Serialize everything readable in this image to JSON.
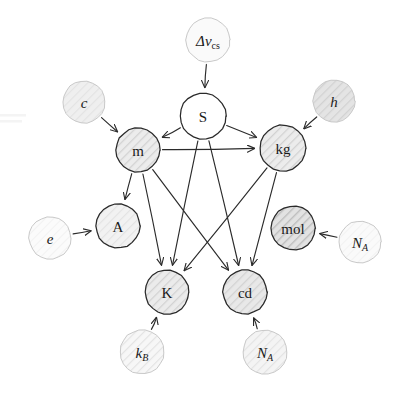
{
  "diagram": {
    "style": "hand-drawn sketch",
    "background_color": "#ffffff",
    "node_outline_color": "#2a2a2a",
    "constant_outline_color": "#c9c9c9",
    "edge_color": "#2b2b2b",
    "label_color": "#1a1a1a"
  },
  "nodes": {
    "dnu_cs": {
      "label": "Δν",
      "subscript": "cs",
      "kind": "constant",
      "cx": 208,
      "cy": 40,
      "r": 22,
      "fill": "#fafafa",
      "hatch": "none"
    },
    "c": {
      "label": "c",
      "subscript": "",
      "kind": "constant",
      "cx": 84,
      "cy": 102,
      "r": 21,
      "fill": "#efefef",
      "hatch": "light"
    },
    "h": {
      "label": "h",
      "subscript": "",
      "kind": "constant",
      "cx": 334,
      "cy": 101,
      "r": 21,
      "fill": "#e4e4e4",
      "hatch": "medium"
    },
    "e": {
      "label": "e",
      "subscript": "",
      "kind": "constant",
      "cx": 50,
      "cy": 238,
      "r": 21,
      "fill": "#fbfbfb",
      "hatch": "faint"
    },
    "NA_mol": {
      "label": "N",
      "subscript": "A",
      "kind": "constant",
      "cx": 360,
      "cy": 242,
      "r": 21,
      "fill": "#fafafa",
      "hatch": "faint"
    },
    "kB": {
      "label": "k",
      "subscript": "B",
      "kind": "constant",
      "cx": 142,
      "cy": 352,
      "r": 22,
      "fill": "#f7f7f7",
      "hatch": "light"
    },
    "NA_cd": {
      "label": "N",
      "subscript": "A",
      "kind": "constant",
      "cx": 265,
      "cy": 352,
      "r": 22,
      "fill": "#f4f4f4",
      "hatch": "light"
    },
    "S": {
      "label": "S",
      "subscript": "",
      "kind": "unit",
      "cx": 203,
      "cy": 116,
      "r": 23,
      "fill": "#ffffff",
      "hatch": "none"
    },
    "m": {
      "label": "m",
      "subscript": "",
      "kind": "unit",
      "cx": 138,
      "cy": 150,
      "r": 22,
      "fill": "#ececec",
      "hatch": "medium"
    },
    "kg": {
      "label": "kg",
      "subscript": "",
      "kind": "unit",
      "cx": 283,
      "cy": 148,
      "r": 23,
      "fill": "#ececec",
      "hatch": "medium"
    },
    "A": {
      "label": "A",
      "subscript": "",
      "kind": "unit",
      "cx": 118,
      "cy": 226,
      "r": 22,
      "fill": "#f2f2f2",
      "hatch": "light"
    },
    "mol": {
      "label": "mol",
      "subscript": "",
      "kind": "unit",
      "cx": 293,
      "cy": 228,
      "r": 22,
      "fill": "#e2e2e2",
      "hatch": "dark"
    },
    "K": {
      "label": "K",
      "subscript": "",
      "kind": "unit",
      "cx": 167,
      "cy": 292,
      "r": 22,
      "fill": "#ebebeb",
      "hatch": "medium"
    },
    "cd": {
      "label": "cd",
      "subscript": "",
      "kind": "unit",
      "cx": 245,
      "cy": 292,
      "r": 22,
      "fill": "#e8e8e8",
      "hatch": "medium"
    }
  },
  "edges": [
    {
      "from": "dnu_cs",
      "to": "S",
      "name": "edge-dnucs-to-s"
    },
    {
      "from": "c",
      "to": "m",
      "name": "edge-c-to-m"
    },
    {
      "from": "h",
      "to": "kg",
      "name": "edge-h-to-kg"
    },
    {
      "from": "e",
      "to": "A",
      "name": "edge-e-to-a"
    },
    {
      "from": "NA_mol",
      "to": "mol",
      "name": "edge-na-to-mol"
    },
    {
      "from": "kB",
      "to": "K",
      "name": "edge-kb-to-k"
    },
    {
      "from": "NA_cd",
      "to": "cd",
      "name": "edge-na-to-cd"
    },
    {
      "from": "S",
      "to": "m",
      "name": "edge-s-to-m"
    },
    {
      "from": "S",
      "to": "kg",
      "name": "edge-s-to-kg"
    },
    {
      "from": "S",
      "to": "K",
      "name": "edge-s-to-k"
    },
    {
      "from": "S",
      "to": "cd",
      "name": "edge-s-to-cd"
    },
    {
      "from": "m",
      "to": "kg",
      "name": "edge-m-to-kg"
    },
    {
      "from": "m",
      "to": "A",
      "name": "edge-m-to-a"
    },
    {
      "from": "m",
      "to": "K",
      "name": "edge-m-to-k"
    },
    {
      "from": "m",
      "to": "cd",
      "name": "edge-m-to-cd"
    },
    {
      "from": "kg",
      "to": "K",
      "name": "edge-kg-to-k"
    },
    {
      "from": "kg",
      "to": "cd",
      "name": "edge-kg-to-cd"
    }
  ]
}
